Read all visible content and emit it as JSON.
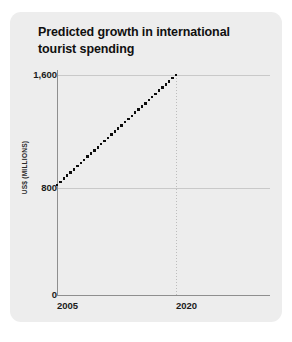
{
  "card": {
    "background_color": "#ededed"
  },
  "title": {
    "text": "Predicted growth in international tourist spending"
  },
  "axis": {
    "y_title": "US$ (MILLIONS)",
    "y_ticks": [
      "1,600",
      "800",
      "0"
    ],
    "x_ticks": [
      "2005",
      "2020"
    ]
  },
  "chart_data": {
    "type": "line",
    "title": "Predicted growth in international tourist spending",
    "subtitle": "",
    "xlabel": "",
    "ylabel": "US$ (MILLIONS)",
    "x": [
      2005,
      2020
    ],
    "series": [
      {
        "name": "Predicted tourist spending",
        "values": [
          800,
          1600
        ],
        "style": "dotted",
        "color": "#0d0d0d"
      }
    ],
    "xtick_labels": [
      "2005",
      "2020"
    ],
    "xtick_values": [
      2005,
      2020
    ],
    "ytick_labels": [
      "0",
      "800",
      "1,600"
    ],
    "ytick_values": [
      0,
      800,
      1600
    ],
    "xlim": [
      2005,
      2026
    ],
    "ylim": [
      0,
      1700
    ],
    "grid": true,
    "grid_lines": [
      "y=800",
      "y=1600",
      "x=2020"
    ],
    "legend": false,
    "annotations": []
  }
}
